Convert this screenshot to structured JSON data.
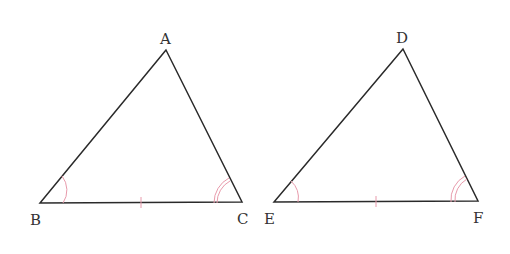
{
  "diagram": {
    "type": "congruent-triangles",
    "colors": {
      "line": "#2a2a2a",
      "mark": "#e89aab",
      "label": "#333333"
    },
    "triangles": [
      {
        "name": "ABC",
        "vertices": {
          "A": {
            "label": "A",
            "x": 166,
            "y": 50
          },
          "B": {
            "label": "B",
            "x": 40,
            "y": 203
          },
          "C": {
            "label": "C",
            "x": 242,
            "y": 202
          }
        },
        "marks": {
          "side_tick": "BC",
          "single_arc": "B",
          "double_arc": "C"
        }
      },
      {
        "name": "DEF",
        "vertices": {
          "D": {
            "label": "D",
            "x": 403,
            "y": 49
          },
          "E": {
            "label": "E",
            "x": 274,
            "y": 202
          },
          "F": {
            "label": "F",
            "x": 478,
            "y": 201
          }
        },
        "marks": {
          "side_tick": "EF",
          "single_arc": "E",
          "double_arc": "F"
        }
      }
    ]
  }
}
